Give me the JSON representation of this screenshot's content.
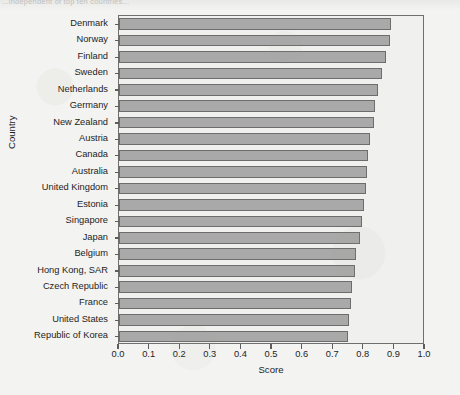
{
  "page": {
    "cut_header_text": "...independent of top ten countries..."
  },
  "chart_data": {
    "type": "bar",
    "orientation": "horizontal",
    "title": "",
    "xlabel": "Score",
    "ylabel": "Country",
    "xlim": [
      0.0,
      1.0
    ],
    "xticks": [
      0.0,
      0.1,
      0.2,
      0.3,
      0.4,
      0.5,
      0.6,
      0.7,
      0.8,
      0.9,
      1.0
    ],
    "xtick_labels": [
      "0.0",
      "0.1",
      "0.2",
      "0.3",
      "0.4",
      "0.5",
      "0.6",
      "0.7",
      "0.8",
      "0.9",
      "1.0"
    ],
    "grid": false,
    "legend": false,
    "bar_fill_color": "#a9a9a9",
    "bar_edge_color": "#6d6d6d",
    "categories": [
      "Denmark",
      "Norway",
      "Finland",
      "Sweden",
      "Netherlands",
      "Germany",
      "New Zealand",
      "Austria",
      "Canada",
      "Australia",
      "United Kingdom",
      "Estonia",
      "Singapore",
      "Japan",
      "Belgium",
      "Hong Kong, SAR",
      "Czech Republic",
      "France",
      "United States",
      "Republic of Korea"
    ],
    "values": [
      0.888,
      0.885,
      0.872,
      0.86,
      0.845,
      0.838,
      0.832,
      0.82,
      0.814,
      0.81,
      0.806,
      0.8,
      0.794,
      0.786,
      0.776,
      0.77,
      0.762,
      0.758,
      0.752,
      0.748
    ]
  }
}
